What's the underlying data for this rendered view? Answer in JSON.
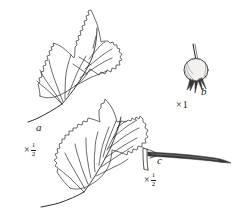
{
  "plate": {
    "title": "Botanical illustration plate",
    "background_color": "#ffffff",
    "ink_color": "#1a1a1a",
    "figures": [
      {
        "key": "a",
        "label": "a",
        "name": "leaves",
        "description": "Two leaves with serrate margins and pinnate venation; upper leaf three-lobed, lower leaf ovate",
        "scale_prefix": "×",
        "scale_numerator": "1",
        "scale_denominator": "2",
        "scale_text": "× ½"
      },
      {
        "key": "b",
        "label": "b",
        "name": "fruit",
        "description": "Rounded fruit on a slender stalk with persistent calyx lobes at the base",
        "scale_prefix": "×",
        "scale_value": "1",
        "scale_text": "× 1"
      },
      {
        "key": "c",
        "label": "c",
        "name": "thorn",
        "description": "Long slender tapering thorn with a forked bracteole base",
        "scale_prefix": "×",
        "scale_numerator": "1",
        "scale_denominator": "2",
        "scale_text": "× ½"
      }
    ]
  }
}
